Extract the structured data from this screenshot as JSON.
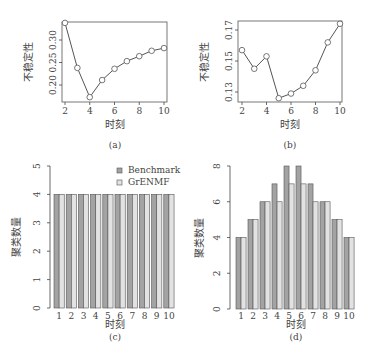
{
  "chart_data": [
    {
      "panel": "(a)",
      "type": "line",
      "xlabel": "时刻",
      "ylabel": "不稳定性",
      "x": [
        2,
        3,
        4,
        5,
        6,
        7,
        8,
        9,
        10
      ],
      "values": [
        0.338,
        0.238,
        0.173,
        0.211,
        0.236,
        0.253,
        0.264,
        0.276,
        0.282
      ],
      "xticks": [
        "2",
        "4",
        "6",
        "8",
        "10"
      ],
      "yticks": [
        "0.20",
        "0.25",
        "0.30"
      ],
      "xlim": [
        2,
        10
      ],
      "ylim": [
        0.17,
        0.34
      ],
      "marker": "circle",
      "grid": false
    },
    {
      "panel": "(b)",
      "type": "line",
      "xlabel": "时刻",
      "ylabel": "不稳定性",
      "x": [
        2,
        3,
        4,
        5,
        6,
        7,
        8,
        9,
        10
      ],
      "values": [
        0.157,
        0.145,
        0.153,
        0.126,
        0.129,
        0.134,
        0.144,
        0.162,
        0.174
      ],
      "xticks": [
        "2",
        "4",
        "6",
        "8",
        "10"
      ],
      "yticks": [
        "0.13",
        "0.15",
        "0.17"
      ],
      "xlim": [
        2,
        10
      ],
      "ylim": [
        0.125,
        0.175
      ],
      "marker": "circle",
      "grid": false
    },
    {
      "panel": "(c)",
      "type": "bar",
      "xlabel": "时刻",
      "ylabel": "聚类数量",
      "categories": [
        "1",
        "2",
        "3",
        "4",
        "5",
        "6",
        "7",
        "8",
        "9",
        "10"
      ],
      "series": [
        {
          "name": "Benchmark",
          "color": "#a3a3a3",
          "values": [
            4,
            4,
            4,
            4,
            4,
            4,
            4,
            4,
            4,
            4
          ]
        },
        {
          "name": "GrENMF",
          "color": "#e2e2e2",
          "values": [
            4,
            4,
            4,
            4,
            4,
            4,
            4,
            4,
            4,
            4
          ]
        }
      ],
      "yticks": [
        "0",
        "1",
        "2",
        "3",
        "4",
        "5"
      ],
      "ylim": [
        0,
        5
      ],
      "legend_position": "top-right",
      "grid": false
    },
    {
      "panel": "(d)",
      "type": "bar",
      "xlabel": "时刻",
      "ylabel": "聚类数量",
      "categories": [
        "1",
        "2",
        "3",
        "4",
        "5",
        "6",
        "7",
        "8",
        "9",
        "10"
      ],
      "series": [
        {
          "name": "Benchmark",
          "color": "#a3a3a3",
          "values": [
            4,
            5,
            6,
            7,
            8,
            8,
            7,
            6,
            5,
            4
          ]
        },
        {
          "name": "GrENMF",
          "color": "#e2e2e2",
          "values": [
            4,
            5,
            6,
            6,
            7,
            7,
            6,
            6,
            5,
            4
          ]
        }
      ],
      "yticks": [
        "0",
        "2",
        "4",
        "6",
        "8"
      ],
      "ylim": [
        0,
        8
      ],
      "grid": false
    }
  ],
  "captions": [
    "(a)",
    "(b)",
    "(c)",
    "(d)"
  ],
  "legend": [
    "Benchmark",
    "GrENMF"
  ]
}
